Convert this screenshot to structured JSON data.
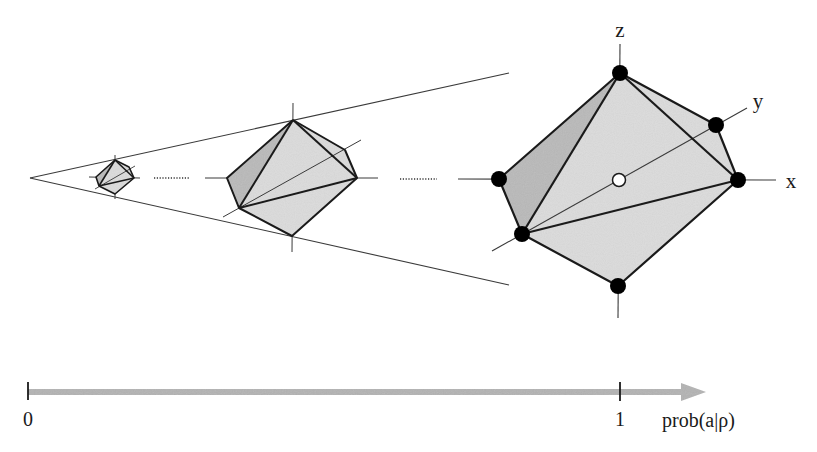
{
  "diagram": {
    "axis_labels": {
      "x": "x",
      "y": "y",
      "z": "z"
    },
    "probability_axis": {
      "tick_start_label": "0",
      "tick_end_label": "1",
      "axis_label": "prob(a|ρ)"
    },
    "colors": {
      "face_light": "#dcdcdc",
      "face_dark": "#b9b9b9",
      "edge": "#1a1a1a",
      "axis_line": "#3a3a3a",
      "arrow_fill": "#b3b3b3",
      "vertex_filled": "#000000",
      "vertex_hollow": "#ffffff"
    },
    "octahedra": [
      {
        "name": "small",
        "scale": "small"
      },
      {
        "name": "medium",
        "scale": "medium"
      },
      {
        "name": "large",
        "scale": "large",
        "vertices_marked": 6,
        "center_marker": "hollow"
      }
    ]
  }
}
